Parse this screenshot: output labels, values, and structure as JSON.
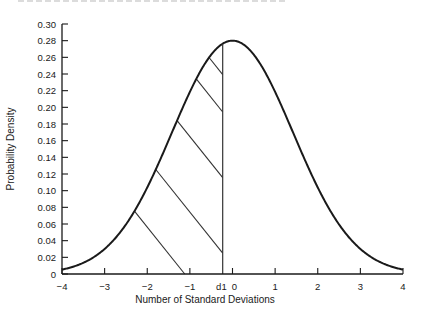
{
  "chart_data": {
    "type": "line",
    "title": "",
    "xlabel": "Number of Standard Deviations",
    "ylabel": "Probability Density",
    "xlim": [
      -4,
      4
    ],
    "ylim": [
      0,
      0.3
    ],
    "grid": false,
    "legend": null,
    "x_ticks": [
      -4,
      -3,
      -2,
      -1,
      0,
      1,
      2,
      3,
      4
    ],
    "x_tick_labels": [
      "−4",
      "−3",
      "−2",
      "−1",
      "0",
      "1",
      "2",
      "3",
      "4"
    ],
    "y_ticks": [
      0,
      0.02,
      0.04,
      0.06,
      0.08,
      0.1,
      0.12,
      0.14,
      0.16,
      0.18,
      0.2,
      0.22,
      0.24,
      0.26,
      0.28,
      0.3
    ],
    "y_tick_labels": [
      "0",
      "0.02",
      "0.04",
      "0.06",
      "0.08",
      "0.10",
      "0.12",
      "0.14",
      "0.16",
      "0.18",
      "0.20",
      "0.22",
      "0.24",
      "0.26",
      "0.28",
      "0.30"
    ],
    "series": [
      {
        "name": "Normal density curve",
        "distribution": "normal",
        "mean": 0,
        "peak_density": 0.28,
        "x": [
          -4,
          -3.5,
          -3,
          -2.5,
          -2,
          -1.5,
          -1,
          -0.5,
          0,
          0.5,
          1,
          1.5,
          2,
          2.5,
          3,
          3.5,
          4
        ],
        "y": [
          0.0001,
          0.0006,
          0.0031,
          0.0122,
          0.0379,
          0.0908,
          0.1694,
          0.2471,
          0.28,
          0.2471,
          0.1694,
          0.0908,
          0.0379,
          0.0122,
          0.0031,
          0.0006,
          0.0001
        ]
      }
    ],
    "annotations": [
      {
        "type": "vertical_line",
        "x": -0.23,
        "label": "d1",
        "label_position": "x-axis"
      },
      {
        "type": "hatched_region",
        "from": -4,
        "to": -0.23,
        "description": "shaded area under curve left of d1 (diagonal hatching)"
      }
    ]
  }
}
